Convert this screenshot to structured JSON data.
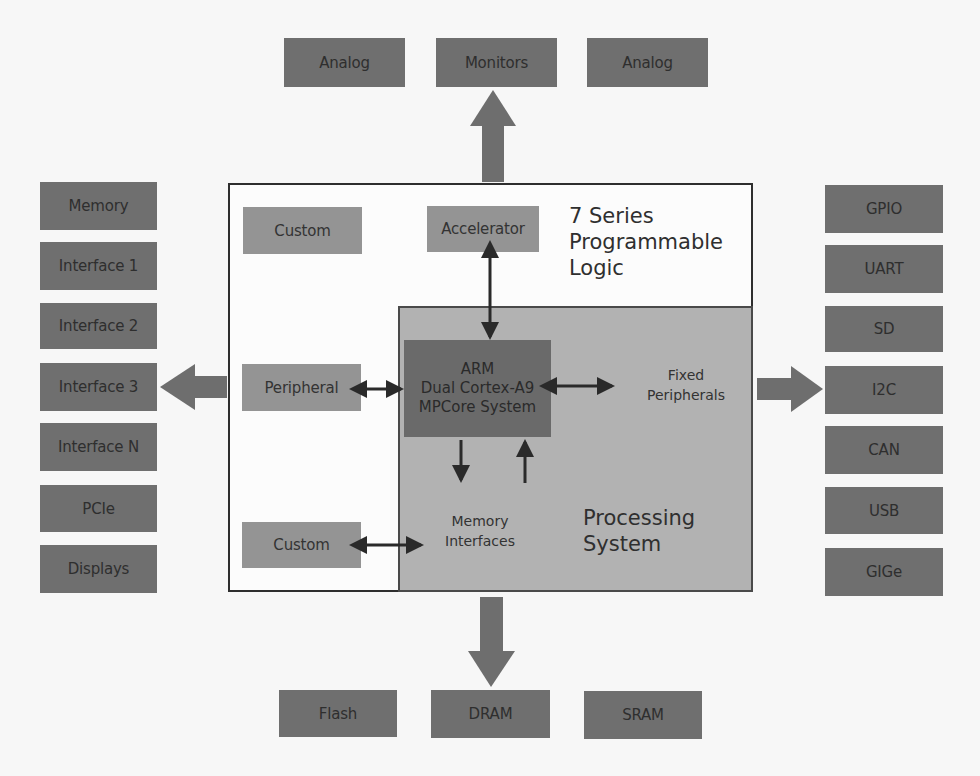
{
  "top_row": {
    "items": [
      {
        "label": "Analog"
      },
      {
        "label": "Monitors"
      },
      {
        "label": "Analog"
      }
    ]
  },
  "left_column": {
    "items": [
      {
        "label": "Memory"
      },
      {
        "label": "Interface 1"
      },
      {
        "label": "Interface 2"
      },
      {
        "label": "Interface 3"
      },
      {
        "label": "Interface N"
      },
      {
        "label": "PCIe"
      },
      {
        "label": "Displays"
      }
    ]
  },
  "right_column": {
    "items": [
      {
        "label": "GPIO"
      },
      {
        "label": "UART"
      },
      {
        "label": "SD"
      },
      {
        "label": "I2C"
      },
      {
        "label": "CAN"
      },
      {
        "label": "USB"
      },
      {
        "label": "GIGe"
      }
    ]
  },
  "bottom_row": {
    "items": [
      {
        "label": "Flash"
      },
      {
        "label": "DRAM"
      },
      {
        "label": "SRAM"
      }
    ]
  },
  "programmable_logic": {
    "title_lines": [
      "7 Series",
      "Programmable",
      "Logic"
    ],
    "blocks": {
      "custom_top": "Custom",
      "accelerator": "Accelerator",
      "peripheral": "Peripheral",
      "custom_bottom": "Custom"
    }
  },
  "processing_system": {
    "title_lines": [
      "Processing",
      "System"
    ],
    "arm_lines": [
      "ARM",
      "Dual Cortex-A9",
      "MPCore System"
    ],
    "fixed_peripherals_lines": [
      "Fixed",
      "Peripherals"
    ],
    "memory_interfaces_lines": [
      "Memory",
      "Interfaces"
    ]
  },
  "colors": {
    "external_block": "#6f6f6f",
    "pl_block": "#949494",
    "ps_region": "#b2b2b2",
    "arm_core": "#6a6a6a",
    "big_arrow": "#6e6e6e",
    "small_arrow": "#2a2a2a"
  }
}
